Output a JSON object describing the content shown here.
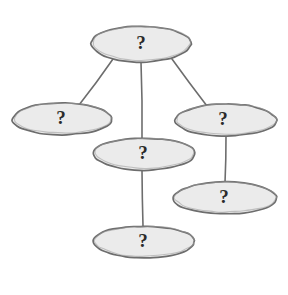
{
  "diagram": {
    "type": "node-link-diagram",
    "style": "hand-drawn sketch",
    "background_color": "#ffffff",
    "node_fill_color": "#ebebeb",
    "node_stroke_color": "#6d6d6d",
    "label_color": "#2b2b2b",
    "nodes": [
      {
        "id": "node-top",
        "label": "?",
        "cx": 141,
        "cy": 44,
        "rx": 50,
        "ry": 18,
        "label_x": 141,
        "label_y": 44
      },
      {
        "id": "node-left",
        "label": "?",
        "cx": 62,
        "cy": 119,
        "rx": 50,
        "ry": 16,
        "label_x": 61,
        "label_y": 119
      },
      {
        "id": "node-right",
        "label": "?",
        "cx": 226,
        "cy": 120,
        "rx": 51,
        "ry": 16,
        "label_x": 223,
        "label_y": 120
      },
      {
        "id": "node-middle",
        "label": "?",
        "cx": 144,
        "cy": 154,
        "rx": 51,
        "ry": 16,
        "label_x": 143,
        "label_y": 154
      },
      {
        "id": "node-bottom-right",
        "label": "?",
        "cx": 225,
        "cy": 198,
        "rx": 52,
        "ry": 16,
        "label_x": 224,
        "label_y": 198
      },
      {
        "id": "node-bottom",
        "label": "?",
        "cx": 144,
        "cy": 242,
        "rx": 51,
        "ry": 16,
        "label_x": 143,
        "label_y": 242
      }
    ],
    "edges": [
      {
        "id": "edge-top-left",
        "from": "node-top",
        "to": "node-left",
        "x1": 113,
        "y1": 59,
        "x2": 79,
        "y2": 105
      },
      {
        "id": "edge-top-middle",
        "from": "node-top",
        "to": "node-middle",
        "x1": 141,
        "y1": 62,
        "x2": 142,
        "y2": 138
      },
      {
        "id": "edge-top-right",
        "from": "node-top",
        "to": "node-right",
        "x1": 172,
        "y1": 59,
        "x2": 207,
        "y2": 106
      },
      {
        "id": "edge-right-bottomright",
        "from": "node-right",
        "to": "node-bottom-right",
        "x1": 226,
        "y1": 136,
        "x2": 225,
        "y2": 183
      },
      {
        "id": "edge-middle-bottom",
        "from": "node-middle",
        "to": "node-bottom",
        "x1": 142,
        "y1": 170,
        "x2": 143,
        "y2": 226
      }
    ]
  }
}
